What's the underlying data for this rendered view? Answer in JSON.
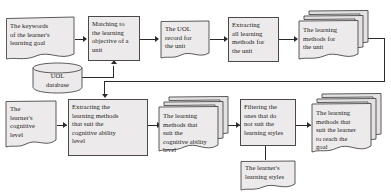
{
  "diagram": {
    "palette": {
      "node_fill": "#eceaea",
      "node_stroke": "#4a4a4a",
      "connector": "#2b2b2b",
      "background": "#ffffff",
      "text": "#1a1a1a"
    },
    "nodes": [
      {
        "id": "keywords",
        "shape": "document",
        "label": "The keywords\nof the learner's\nlearning goal"
      },
      {
        "id": "matching",
        "shape": "process",
        "label": "Matching to\nthe learning\nobjective of a\nunit"
      },
      {
        "id": "uol_record",
        "shape": "document",
        "label": "The UOL\nrecord for\nthe unit"
      },
      {
        "id": "extract_all",
        "shape": "process",
        "label": "Extracting\nall learning\nmethods for\nthe unit"
      },
      {
        "id": "methods_unit",
        "shape": "multidoc",
        "label": "The learning\nmethods for\nthe unit"
      },
      {
        "id": "uol_database",
        "shape": "database",
        "label": "UOL\ndatabase"
      },
      {
        "id": "cognitive_level",
        "shape": "document",
        "label": "The\nlearner's\ncognitive\nlevel"
      },
      {
        "id": "extract_cog",
        "shape": "process",
        "label": "Extracting the\nlearning methods\nthat suit the\ncognitive ability\nlevel"
      },
      {
        "id": "methods_cog",
        "shape": "multidoc",
        "label": "The learning\nmethods that\nsuit the\ncognitive ability\nlevel"
      },
      {
        "id": "filtering",
        "shape": "process",
        "label": "Filtering the\nones that do\nnot suit the\nlearning styles"
      },
      {
        "id": "learning_styles",
        "shape": "document",
        "label": "The learner's\nlearning styles"
      },
      {
        "id": "methods_goal",
        "shape": "multidoc",
        "label": "The learning\nmethods that\nsuit the learner\nto reach the\ngoal"
      }
    ],
    "edges": [
      {
        "from": "keywords",
        "to": "matching"
      },
      {
        "from": "matching",
        "to": "uol_record"
      },
      {
        "from": "uol_record",
        "to": "extract_all"
      },
      {
        "from": "extract_all",
        "to": "methods_unit"
      },
      {
        "from": "uol_database",
        "to": "matching"
      },
      {
        "from": "methods_unit",
        "to": "extract_cog"
      },
      {
        "from": "cognitive_level",
        "to": "extract_cog"
      },
      {
        "from": "extract_cog",
        "to": "methods_cog"
      },
      {
        "from": "methods_cog",
        "to": "filtering"
      },
      {
        "from": "learning_styles",
        "to": "filtering"
      },
      {
        "from": "filtering",
        "to": "methods_goal"
      }
    ]
  }
}
